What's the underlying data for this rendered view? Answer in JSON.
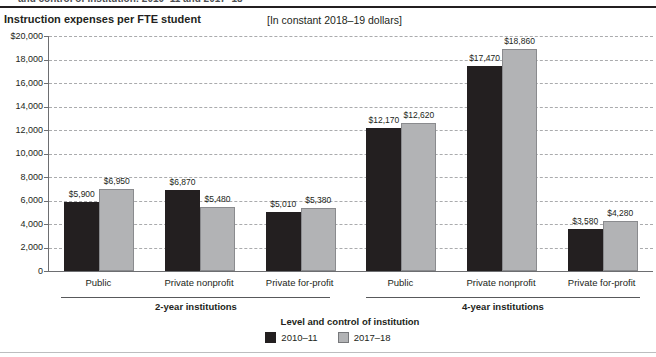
{
  "header": {
    "clipped_caption": "and control of institution: 2010–11 and 2017–18",
    "title": "Instruction expenses per FTE student",
    "subtitle": "[In constant 2018–19 dollars]"
  },
  "chart_data": {
    "type": "bar",
    "title": "Instruction expenses per FTE student",
    "subtitle": "[In constant 2018–19 dollars]",
    "xlabel": "Level and control of institution",
    "ylabel": "Instruction expenses per FTE student (dollars)",
    "ylim": [
      0,
      20000
    ],
    "ytick_step": 2000,
    "ytick_labels_top_to_bottom": [
      "$20,000",
      "18,000",
      "16,000",
      "14,000",
      "12,000",
      "10,000",
      "8,000",
      "6,000",
      "4,000",
      "2,000",
      "0"
    ],
    "grid": "horizontal dashed",
    "legend_position": "bottom center",
    "series": [
      {
        "name": "2010–11",
        "color": "#231f20"
      },
      {
        "name": "2017–18",
        "color": "#b2b3b5"
      }
    ],
    "sections": [
      {
        "label": "2-year institutions"
      },
      {
        "label": "4-year institutions"
      }
    ],
    "groups": [
      {
        "section": "2-year institutions",
        "category": "Public",
        "values": [
          5900,
          6950
        ],
        "value_labels": [
          "$5,900",
          "$6,950"
        ]
      },
      {
        "section": "2-year institutions",
        "category": "Private nonprofit",
        "values": [
          6870,
          5480
        ],
        "value_labels": [
          "$6,870",
          "$5,480"
        ]
      },
      {
        "section": "2-year institutions",
        "category": "Private for-profit",
        "values": [
          5010,
          5380
        ],
        "value_labels": [
          "$5,010",
          "$5,380"
        ]
      },
      {
        "section": "4-year institutions",
        "category": "Public",
        "values": [
          12170,
          12620
        ],
        "value_labels": [
          "$12,170",
          "$12,620"
        ]
      },
      {
        "section": "4-year institutions",
        "category": "Private nonprofit",
        "values": [
          17470,
          18860
        ],
        "value_labels": [
          "$17,470",
          "$18,860"
        ]
      },
      {
        "section": "4-year institutions",
        "category": "Private for-profit",
        "values": [
          3580,
          4280
        ],
        "value_labels": [
          "$3,580",
          "$4,280"
        ]
      }
    ]
  }
}
